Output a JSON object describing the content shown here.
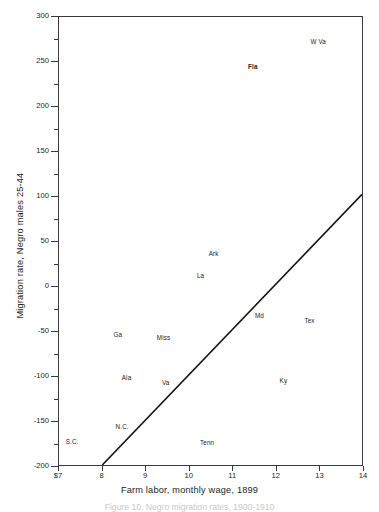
{
  "chart_data": {
    "type": "scatter",
    "title": "",
    "xlabel": "Farm labor, monthly wage, 1899",
    "ylabel": "Migration rate, Negro males 25-44",
    "xlim": [
      7,
      14
    ],
    "ylim": [
      -200,
      300
    ],
    "grid": false,
    "legend": "none",
    "x_tick_labels": [
      "$7",
      "8",
      "9",
      "10",
      "11",
      "12",
      "13",
      "14"
    ],
    "x_ticks": [
      7,
      8,
      9,
      10,
      11,
      12,
      13,
      14
    ],
    "y_tick_labels": [
      "300",
      "250",
      "200",
      "150",
      "100",
      "50",
      "0",
      "-50",
      "-100",
      "-150",
      "-200"
    ],
    "y_ticks": [
      300,
      250,
      200,
      150,
      100,
      50,
      0,
      -50,
      -100,
      -150,
      -200
    ],
    "y_minor_ticks": [
      275,
      225,
      175,
      125,
      75,
      25,
      -25,
      -75,
      -125,
      -175
    ],
    "point_label_field": "state",
    "points": [
      {
        "state": "W Va",
        "x": 12.95,
        "y": 272,
        "bold": false
      },
      {
        "state": "Fla",
        "x": 11.45,
        "y": 245,
        "bold": true
      },
      {
        "state": "Ark",
        "x": 10.55,
        "y": 37,
        "bold": false
      },
      {
        "state": "La",
        "x": 10.25,
        "y": 12,
        "bold": false
      },
      {
        "state": "Md",
        "x": 11.6,
        "y": -32,
        "bold": false
      },
      {
        "state": "Tex",
        "x": 12.75,
        "y": -38,
        "bold": false
      },
      {
        "state": "Ga",
        "x": 8.35,
        "y": -53,
        "bold": false
      },
      {
        "state": "Miss",
        "x": 9.4,
        "y": -57,
        "bold": false
      },
      {
        "state": "Ala",
        "x": 8.55,
        "y": -101,
        "bold": false
      },
      {
        "state": "Va",
        "x": 9.45,
        "y": -107,
        "bold": false
      },
      {
        "state": "Ky",
        "x": 12.15,
        "y": -104,
        "bold": false
      },
      {
        "state": "N.C.",
        "x": 8.45,
        "y": -155,
        "bold": false
      },
      {
        "state": "S.C.",
        "x": 7.3,
        "y": -172,
        "bold": false
      },
      {
        "state": "Tenn",
        "x": 10.4,
        "y": -173,
        "bold": false
      }
    ],
    "trend_line": {
      "x0": 8.0,
      "y0": -200,
      "x1": 14.0,
      "y1": 102,
      "color": "#111111",
      "width": 1.6
    }
  },
  "caption": {
    "text": "Figure 10.  Negro migration rates, 1900-1910"
  }
}
